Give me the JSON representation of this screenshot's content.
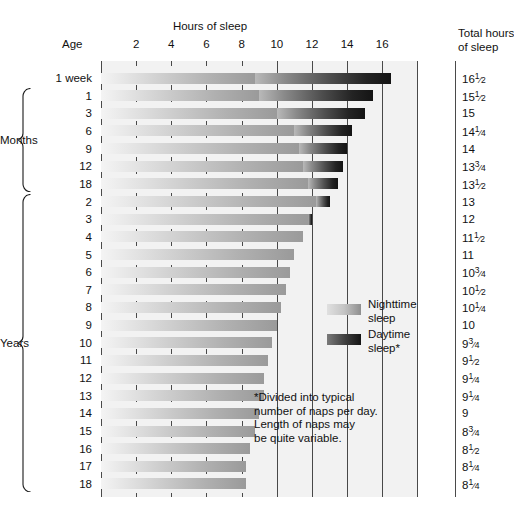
{
  "header": {
    "chart_title": "Hours of sleep",
    "age_header": "Age",
    "total_header_line1": "Total hours",
    "total_header_line2": "of sleep"
  },
  "legend": {
    "night_label_line1": "Nighttime",
    "night_label_line2": "sleep",
    "day_label_line1": "Daytime",
    "day_label_line2": "sleep*",
    "night_color": "#c4c4c4",
    "day_color": "#2a2a2a"
  },
  "footnote": {
    "line1": "*Divided into typical",
    "line2": "number of naps per day.",
    "line3": "Length of naps may",
    "line4": "be quite variable."
  },
  "groups": {
    "months_label": "Months",
    "years_label": "Years"
  },
  "chart_data": {
    "type": "bar",
    "title": "Hours of sleep",
    "xlabel": "Hours of sleep",
    "ylabel": "Age",
    "xlim": [
      0,
      18
    ],
    "grid": true,
    "legend_position": "inside-right",
    "xticks": [
      2,
      4,
      6,
      8,
      10,
      12,
      14,
      16
    ],
    "xtick_labels": [
      "2",
      "4",
      "6",
      "8",
      "10",
      "12",
      "14",
      "16"
    ],
    "categories": [
      "1 week",
      "1",
      "3",
      "6",
      "9",
      "12",
      "18",
      "2",
      "3",
      "4",
      "5",
      "6",
      "7",
      "8",
      "9",
      "10",
      "11",
      "12",
      "13",
      "14",
      "15",
      "16",
      "17",
      "18"
    ],
    "series": [
      {
        "name": "Nighttime sleep",
        "values": [
          8.75,
          9.0,
          10.0,
          11.0,
          11.25,
          11.5,
          11.75,
          12.25,
          11.75,
          11.5,
          11.0,
          10.75,
          10.5,
          10.25,
          10.0,
          9.75,
          9.5,
          9.25,
          9.25,
          9.0,
          8.75,
          8.5,
          8.25,
          8.25
        ]
      },
      {
        "name": "Daytime sleep*",
        "values": [
          7.75,
          6.5,
          5.0,
          3.25,
          2.75,
          2.25,
          1.75,
          0.75,
          0.25,
          0,
          0,
          0,
          0,
          0,
          0,
          0,
          0,
          0,
          0,
          0,
          0,
          0,
          0,
          0
        ]
      }
    ],
    "totals": [
      "16½",
      "15½",
      "15",
      "14¼",
      "14",
      "13¾",
      "13½",
      "13",
      "12",
      "11½",
      "11",
      "10¾",
      "10½",
      "10¼",
      "10",
      "9¾",
      "9½",
      "9¼",
      "9¼",
      "9",
      "8¾",
      "8½",
      "8¼",
      "8¼"
    ],
    "totals_parts": [
      [
        "16",
        "1",
        "2"
      ],
      [
        "15",
        "1",
        "2"
      ],
      [
        "15",
        "",
        ""
      ],
      [
        "14",
        "1",
        "4"
      ],
      [
        "14",
        "",
        ""
      ],
      [
        "13",
        "3",
        "4"
      ],
      [
        "13",
        "1",
        "2"
      ],
      [
        "13",
        "",
        ""
      ],
      [
        "12",
        "",
        ""
      ],
      [
        "11",
        "1",
        "2"
      ],
      [
        "11",
        "",
        ""
      ],
      [
        "10",
        "3",
        "4"
      ],
      [
        "10",
        "1",
        "2"
      ],
      [
        "10",
        "1",
        "4"
      ],
      [
        "10",
        "",
        ""
      ],
      [
        "9",
        "3",
        "4"
      ],
      [
        "9",
        "1",
        "2"
      ],
      [
        "9",
        "1",
        "4"
      ],
      [
        "9",
        "1",
        "4"
      ],
      [
        "9",
        "",
        ""
      ],
      [
        "8",
        "3",
        "4"
      ],
      [
        "8",
        "1",
        "2"
      ],
      [
        "8",
        "1",
        "4"
      ],
      [
        "8",
        "1",
        "4"
      ]
    ],
    "group_brackets": [
      {
        "label": "Months",
        "from_index": 1,
        "to_index": 6
      },
      {
        "label": "Years",
        "from_index": 7,
        "to_index": 23
      }
    ]
  }
}
